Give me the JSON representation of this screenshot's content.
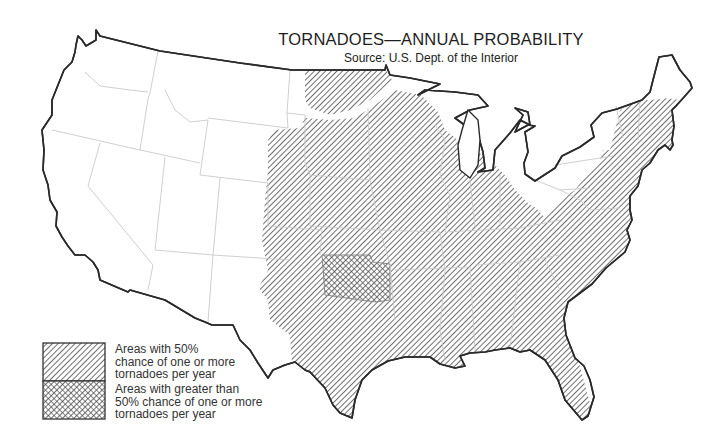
{
  "title": "TORNADOES—ANNUAL PROBABILITY",
  "subtitle": "Source: U.S. Dept. of the Interior",
  "map": {
    "region": "Contiguous United States",
    "outline_color": "#2a2a2a",
    "state_border_color": "#c8c8c8",
    "hatch_color": "#555555",
    "zones": [
      {
        "name": "50% zone",
        "pattern": "diagonal-hatch",
        "description": "Central and eastern US from the Great Plains to the Atlantic coast, including New England"
      },
      {
        "name": "greater than 50% zone",
        "pattern": "cross-hatch",
        "description": "Central Oklahoma / southern Kansas area"
      }
    ]
  },
  "legend": {
    "items": [
      {
        "pattern": "diagonal-hatch",
        "lines": [
          "Areas with 50%",
          "chance of one or more",
          "tornadoes per year"
        ]
      },
      {
        "pattern": "cross-hatch",
        "lines": [
          "Areas with greater than",
          "50% chance of one or more",
          "tornadoes per year"
        ]
      }
    ]
  }
}
